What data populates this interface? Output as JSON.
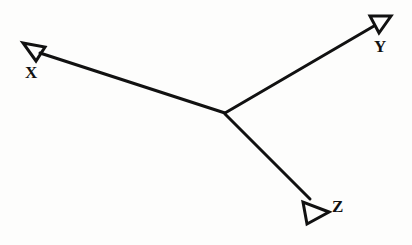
{
  "figure": {
    "background_color": "#fdfdfc",
    "stroke_color": "#111111",
    "stroke_width": 3,
    "origin": {
      "x": 225,
      "y": 113
    }
  },
  "axes": [
    {
      "id": "x",
      "label": "X",
      "label_position": {
        "x": 25,
        "y": 64
      },
      "line": {
        "x1": 225,
        "y1": 113,
        "x2": 40,
        "y2": 53
      },
      "arrowhead": {
        "style": "open-triangle",
        "tip": {
          "x": 23,
          "y": 43
        },
        "points": "23,43 45,47 36,61"
      },
      "direction": "up-left"
    },
    {
      "id": "y",
      "label": "Y",
      "label_position": {
        "x": 374,
        "y": 38
      },
      "line": {
        "x1": 225,
        "y1": 113,
        "x2": 374,
        "y2": 26
      },
      "arrowhead": {
        "style": "open-triangle",
        "tip": {
          "x": 391,
          "y": 16
        },
        "points": "391,16 370,16 379,33"
      },
      "direction": "up-right"
    },
    {
      "id": "z",
      "label": "Z",
      "label_position": {
        "x": 332,
        "y": 198
      },
      "line": {
        "x1": 225,
        "y1": 114,
        "x2": 310,
        "y2": 199
      },
      "arrowhead": {
        "style": "open-triangle",
        "tip": {
          "x": 329,
          "y": 212
        },
        "points": "329,212 303,202 307,224"
      },
      "direction": "down-right"
    }
  ]
}
